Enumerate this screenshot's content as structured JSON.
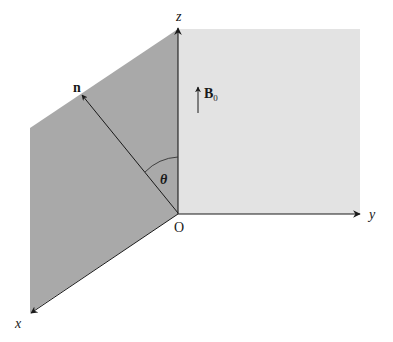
{
  "figure": {
    "type": "3d-coordinate-diagram",
    "colors": {
      "background": "#ffffff",
      "dark_plane": "#a9a9a9",
      "light_plane": "#e3e3e3",
      "axis": "#1a1a1a",
      "text": "#1a1a1a"
    },
    "axes": {
      "x": {
        "label": "x"
      },
      "y": {
        "label": "y"
      },
      "z": {
        "label": "z"
      }
    },
    "origin_label": "O",
    "vectors": {
      "normal": {
        "label": "n"
      },
      "field": {
        "label": "B",
        "subscript": "0"
      }
    },
    "angle_label": "θ",
    "planes": [
      {
        "name": "inclined-plane",
        "shade": "dark"
      },
      {
        "name": "yz-plane",
        "shade": "light"
      }
    ]
  }
}
